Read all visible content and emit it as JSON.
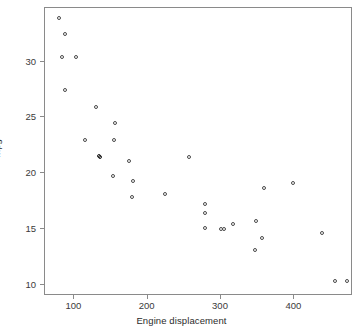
{
  "chart_data": {
    "type": "scatter",
    "title": "",
    "xlabel": "Engine displacement",
    "ylabel": "mpg",
    "xlim": [
      60,
      480
    ],
    "ylim": [
      9,
      34.8
    ],
    "xticks": [
      100,
      200,
      300,
      400
    ],
    "yticks": [
      10,
      15,
      20,
      25,
      30
    ],
    "xtick_labels": [
      "100",
      "200",
      "300",
      "400"
    ],
    "ytick_labels": [
      "10",
      "15",
      "20",
      "25",
      "30"
    ],
    "grid": false,
    "legend": "none",
    "marker_style": "open-circle",
    "marker_color": "#4a4a4a",
    "frame_color": "#8a8a8a",
    "background": "#ffffff",
    "points": [
      {
        "x": 81,
        "y": 33.8
      },
      {
        "x": 89,
        "y": 32.3
      },
      {
        "x": 85,
        "y": 30.3
      },
      {
        "x": 104,
        "y": 30.3
      },
      {
        "x": 89,
        "y": 27.3
      },
      {
        "x": 131,
        "y": 25.8
      },
      {
        "x": 158,
        "y": 24.4
      },
      {
        "x": 116,
        "y": 22.8
      },
      {
        "x": 156,
        "y": 22.8
      },
      {
        "x": 135,
        "y": 21.4
      },
      {
        "x": 137,
        "y": 21.3
      },
      {
        "x": 176,
        "y": 21.0
      },
      {
        "x": 155,
        "y": 19.6
      },
      {
        "x": 182,
        "y": 19.2
      },
      {
        "x": 181,
        "y": 17.7
      },
      {
        "x": 259,
        "y": 21.3
      },
      {
        "x": 226,
        "y": 18.0
      },
      {
        "x": 280,
        "y": 17.1
      },
      {
        "x": 280,
        "y": 16.3
      },
      {
        "x": 280,
        "y": 15.0
      },
      {
        "x": 302,
        "y": 14.9
      },
      {
        "x": 306,
        "y": 14.9
      },
      {
        "x": 318,
        "y": 15.3
      },
      {
        "x": 350,
        "y": 15.6
      },
      {
        "x": 358,
        "y": 14.1
      },
      {
        "x": 348,
        "y": 13.0
      },
      {
        "x": 360,
        "y": 18.5
      },
      {
        "x": 400,
        "y": 19.0
      },
      {
        "x": 440,
        "y": 14.5
      },
      {
        "x": 458,
        "y": 10.2
      },
      {
        "x": 474,
        "y": 10.2
      }
    ]
  },
  "axes": {
    "x_label_text": "Engine displacement",
    "y_label_text": "mpg"
  }
}
